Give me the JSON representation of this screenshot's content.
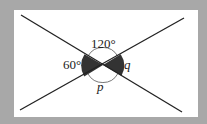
{
  "diagram": {
    "type": "intersecting-lines-angles",
    "background_color": "#a8a8a8",
    "panel_color": "#ffffff",
    "line_color": "#222222",
    "shaded_color": "#333333",
    "labels": {
      "top_angle": "120°",
      "left_angle": "60°",
      "right_angle": "q",
      "bottom_angle": "p"
    }
  }
}
